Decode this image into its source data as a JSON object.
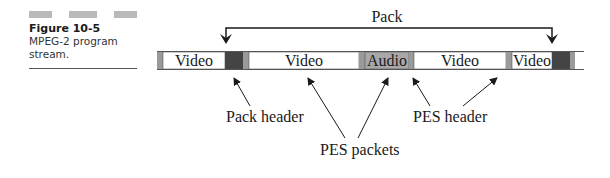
{
  "caption": {
    "figure_number": "Figure 10-5",
    "description": "MPEG-2 program stream."
  },
  "diagram": {
    "pack_label": "Pack",
    "segments": [
      {
        "type": "pes-header",
        "label": ""
      },
      {
        "type": "payload",
        "label": "Video"
      },
      {
        "type": "pack-header",
        "label": ""
      },
      {
        "type": "pes-header",
        "label": ""
      },
      {
        "type": "payload",
        "label": "Video"
      },
      {
        "type": "pes-header",
        "label": ""
      },
      {
        "type": "payload-audio",
        "label": "Audio"
      },
      {
        "type": "pes-header",
        "label": ""
      },
      {
        "type": "payload",
        "label": "Video"
      },
      {
        "type": "pes-header",
        "label": ""
      },
      {
        "type": "payload",
        "label": "Video"
      },
      {
        "type": "pack-header",
        "label": ""
      },
      {
        "type": "pes-header",
        "label": ""
      },
      {
        "type": "payload",
        "label": ""
      }
    ],
    "callouts": {
      "pack_header": "Pack header",
      "pes_packets": "PES packets",
      "pes_header": "PES header"
    },
    "colors": {
      "pack_header": "#444444",
      "pes_header": "#9a9a9a",
      "audio": "#a8a8a8",
      "payload": "#ffffff",
      "outline": "#555555"
    }
  }
}
